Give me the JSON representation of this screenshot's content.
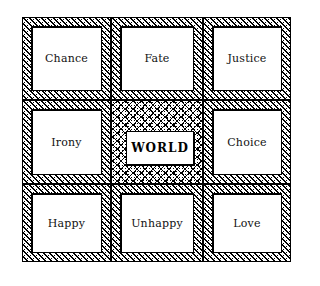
{
  "board": {
    "cells": [
      {
        "label": "Chance"
      },
      {
        "label": "Fate"
      },
      {
        "label": "Justice"
      },
      {
        "label": "Irony"
      },
      {
        "label": "WORLD"
      },
      {
        "label": "Choice"
      },
      {
        "label": "Happy"
      },
      {
        "label": "Unhappy"
      },
      {
        "label": "Love"
      }
    ]
  }
}
